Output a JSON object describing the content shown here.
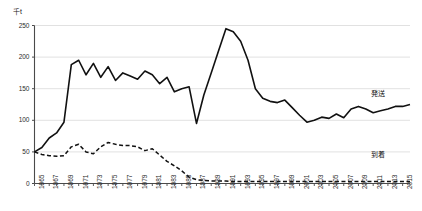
{
  "chart_data": {
    "type": "line",
    "title": "",
    "xlabel": "",
    "ylabel": "千t",
    "unit_label": "千t",
    "ylim": [
      0,
      250
    ],
    "yticks": [
      0,
      50,
      100,
      150,
      200,
      250
    ],
    "ytick_labels": [
      "0",
      "50",
      "100",
      "150",
      "200",
      "250"
    ],
    "xlim": [
      1965,
      2016
    ],
    "xtick_labels": [
      "1965",
      "1967",
      "1969",
      "1971",
      "1973",
      "1975",
      "1977",
      "1979",
      "1981",
      "1983",
      "1985",
      "1987",
      "1989",
      "1991",
      "1993",
      "1995",
      "1997",
      "1999",
      "2001",
      "2003",
      "2005",
      "2007",
      "2009",
      "2011",
      "2013",
      "2015"
    ],
    "grid": true,
    "grid_axis": "y",
    "legend_position": "inline-right",
    "x": [
      1965,
      1966,
      1967,
      1968,
      1969,
      1970,
      1971,
      1972,
      1973,
      1974,
      1975,
      1976,
      1977,
      1978,
      1979,
      1980,
      1981,
      1982,
      1983,
      1984,
      1985,
      1986,
      1987,
      1988,
      1989,
      1990,
      1991,
      1992,
      1993,
      1994,
      1995,
      1996,
      1997,
      1998,
      1999,
      2000,
      2001,
      2002,
      2003,
      2004,
      2005,
      2006,
      2007,
      2008,
      2009,
      2010,
      2011,
      2012,
      2013,
      2014,
      2015,
      2016
    ],
    "series": [
      {
        "name": "発送",
        "label": "発送",
        "style": "solid",
        "color": "#111111",
        "values": [
          50,
          57,
          72,
          80,
          97,
          188,
          195,
          172,
          190,
          168,
          185,
          163,
          175,
          170,
          165,
          178,
          172,
          158,
          168,
          145,
          150,
          153,
          95,
          140,
          175,
          210,
          245,
          240,
          225,
          195,
          150,
          135,
          130,
          128,
          132,
          120,
          108,
          97,
          100,
          105,
          103,
          110,
          104,
          118,
          122,
          118,
          112,
          115,
          118,
          122,
          122,
          125
        ]
      },
      {
        "name": "到着",
        "label": "到着",
        "style": "dashed",
        "color": "#111111",
        "values": [
          50,
          46,
          44,
          43,
          44,
          58,
          62,
          50,
          47,
          58,
          65,
          62,
          60,
          60,
          58,
          52,
          55,
          45,
          35,
          28,
          20,
          10,
          6,
          5,
          4,
          4,
          4,
          3,
          3,
          3,
          3,
          3,
          3,
          3,
          3,
          3,
          3,
          3,
          3,
          3,
          3,
          3,
          3,
          3,
          3,
          3,
          3,
          3,
          3,
          3,
          3,
          3
        ]
      }
    ]
  }
}
